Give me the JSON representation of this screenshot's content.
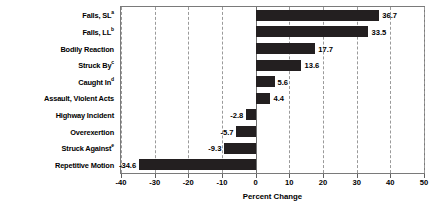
{
  "chart_data": {
    "type": "bar",
    "orientation": "horizontal",
    "title": "",
    "xlabel": "Percent Change",
    "ylabel": "",
    "xlim": [
      -40,
      50
    ],
    "xticks": [
      -40,
      -30,
      -20,
      -10,
      0,
      10,
      20,
      30,
      40,
      50
    ],
    "xticklabels": [
      "-40",
      "-30",
      "-20",
      "-10",
      "0",
      "10",
      "20",
      "30",
      "40",
      "50"
    ],
    "grid": "vertical-dashed",
    "legend": "none",
    "bar_color": "#231f20",
    "categories": [
      "Falls, SL",
      "Falls, LL",
      "Bodily Reaction",
      "Struck By",
      "Caught In",
      "Assault, Violent Acts",
      "Highway Incident",
      "Overexertion",
      "Struck Against",
      "Repetitive Motion"
    ],
    "category_footnotes": [
      "a",
      "b",
      "",
      "c",
      "d",
      "",
      "",
      "",
      "e",
      ""
    ],
    "values": [
      36.7,
      33.5,
      17.7,
      13.6,
      5.6,
      4.4,
      -2.8,
      -5.7,
      -9.3,
      -34.6
    ],
    "value_labels": [
      "36.7",
      "33.5",
      "17.7",
      "13.6",
      "5.6",
      "4.4",
      "-2.8",
      "-5.7",
      "-9.3",
      "-34.6"
    ]
  }
}
